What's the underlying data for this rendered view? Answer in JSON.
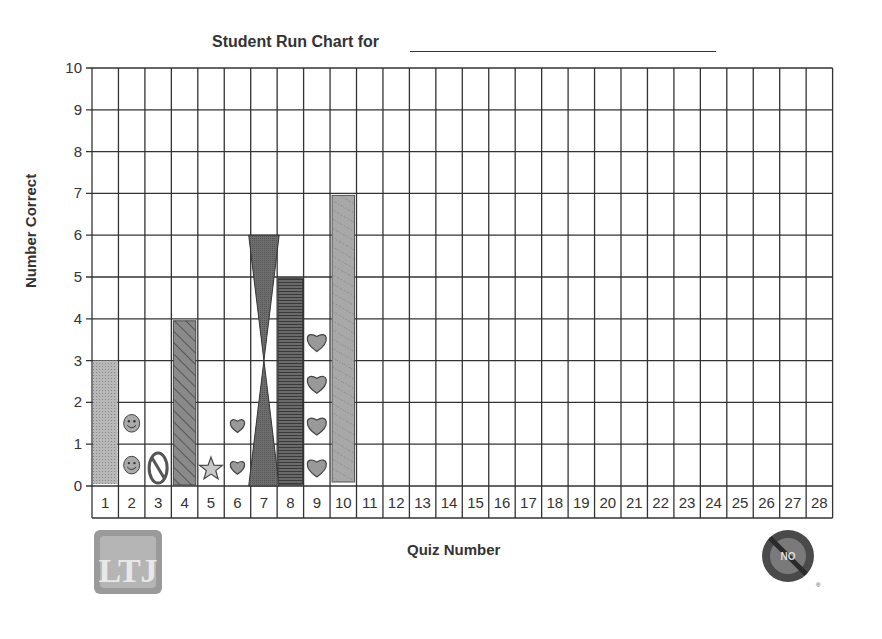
{
  "header": {
    "title": "Student Run Chart for",
    "name_blank": ""
  },
  "axes": {
    "ylabel": "Number Correct",
    "xlabel": "Quiz Number"
  },
  "y_ticks": [
    "0",
    "1",
    "2",
    "3",
    "4",
    "5",
    "6",
    "7",
    "8",
    "9",
    "10"
  ],
  "x_ticks": [
    "1",
    "2",
    "3",
    "4",
    "5",
    "6",
    "7",
    "8",
    "9",
    "10",
    "11",
    "12",
    "13",
    "14",
    "15",
    "16",
    "17",
    "18",
    "19",
    "20",
    "21",
    "22",
    "23",
    "24",
    "25",
    "26",
    "27",
    "28"
  ],
  "logos": {
    "left": "LTJ",
    "right_lines": [
      "Permission",
      "NO",
      "to Forget"
    ]
  },
  "chart_data": {
    "type": "bar",
    "xlabel": "Quiz Number",
    "ylabel": "Number Correct",
    "categories": [
      1,
      2,
      3,
      4,
      5,
      6,
      7,
      8,
      9,
      10,
      11,
      12,
      13,
      14,
      15,
      16,
      17,
      18,
      19,
      20,
      21,
      22,
      23,
      24,
      25,
      26,
      27,
      28
    ],
    "values": [
      3,
      2,
      1,
      4,
      1,
      2,
      6,
      5,
      4,
      7,
      null,
      null,
      null,
      null,
      null,
      null,
      null,
      null,
      null,
      null,
      null,
      null,
      null,
      null,
      null,
      null,
      null,
      null
    ],
    "markers": [
      "bar-stipple",
      "smiley-faces",
      "no-symbol",
      "bar-hatched",
      "star",
      "hearts",
      "hourglass",
      "bar-striped",
      "hearts",
      "bar-dotted"
    ],
    "ylim": [
      0,
      10
    ],
    "grid": true,
    "legend": null
  }
}
